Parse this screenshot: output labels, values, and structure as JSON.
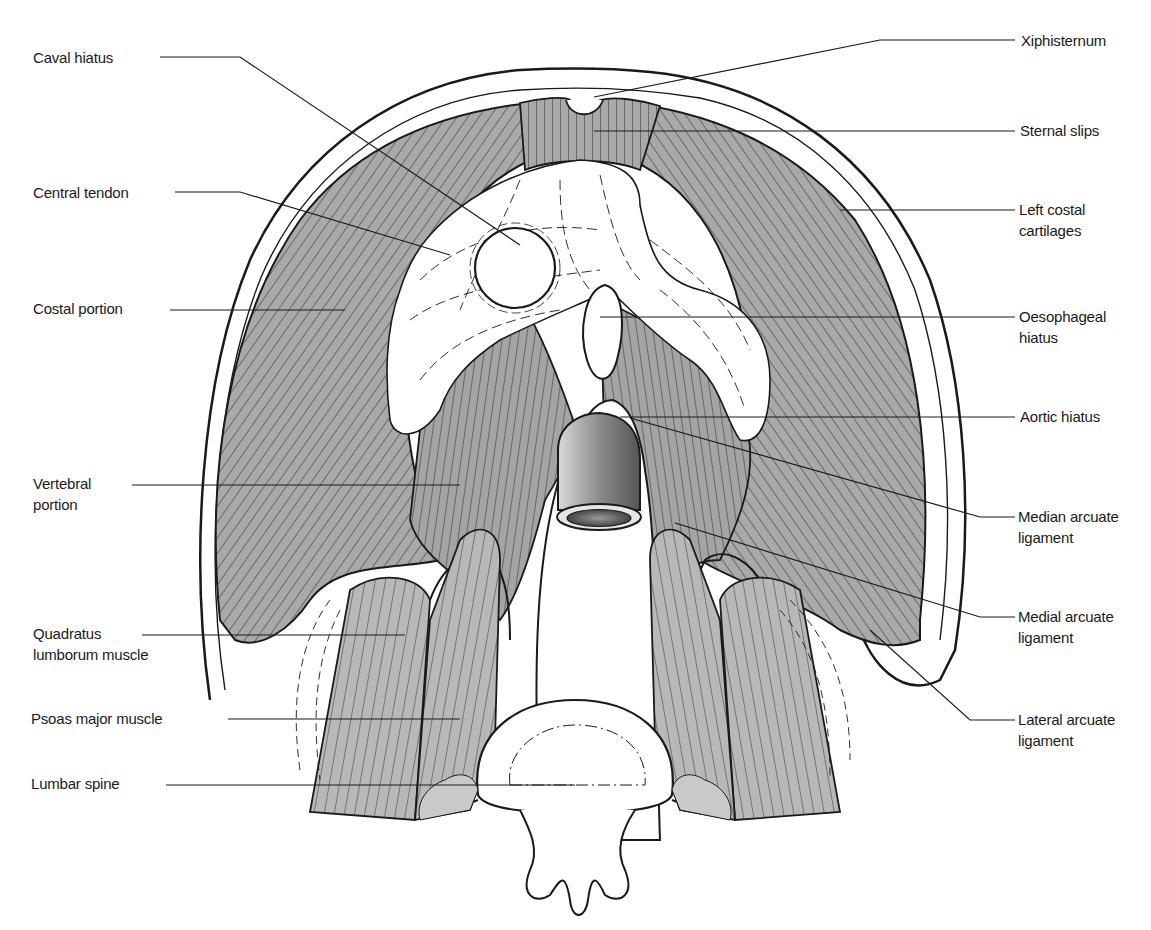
{
  "figure": {
    "colors": {
      "muscle_fill": "#a9a9a9",
      "muscle_light": "#c8c8c8",
      "tendon_fill": "#ffffff",
      "outline": "#1a1a1a",
      "aorta_dark": "#6e6e6e",
      "aorta_light": "#d9d9d9",
      "background": "#ffffff"
    },
    "labels_left": [
      {
        "id": "caval-hiatus",
        "text": "Caval hiatus",
        "x": 33,
        "y": 47
      },
      {
        "id": "central-tendon",
        "text": "Central tendon",
        "x": 33,
        "y": 182
      },
      {
        "id": "costal-portion",
        "text": "Costal portion",
        "x": 33,
        "y": 298
      },
      {
        "id": "vertebral-portion",
        "text": "Vertebral\nportion",
        "x": 33,
        "y": 473
      },
      {
        "id": "quadratus-lumborum",
        "text": "Quadratus\nlumborum muscle",
        "x": 33,
        "y": 623
      },
      {
        "id": "psoas-major",
        "text": "Psoas major muscle",
        "x": 31,
        "y": 708
      },
      {
        "id": "lumbar-spine",
        "text": "Lumbar spine",
        "x": 31,
        "y": 773
      }
    ],
    "labels_right": [
      {
        "id": "xiphisternum",
        "text": "Xiphisternum",
        "x": 1021,
        "y": 32
      },
      {
        "id": "sternal-slips",
        "text": "Sternal slips",
        "x": 1020,
        "y": 121
      },
      {
        "id": "left-costal-cartilages",
        "text": "Left costal\ncartilages",
        "x": 1019,
        "y": 200
      },
      {
        "id": "oesophageal-hiatus",
        "text": "Oesophageal\nhiatus",
        "x": 1019,
        "y": 305
      },
      {
        "id": "aortic-hiatus",
        "text": "Aortic hiatus",
        "x": 1020,
        "y": 405
      },
      {
        "id": "median-arcuate-ligament",
        "text": "Median arcuate\nligament",
        "x": 1018,
        "y": 505
      },
      {
        "id": "medial-arcuate-ligament",
        "text": "Medial arcuate\nligament",
        "x": 1018,
        "y": 605
      },
      {
        "id": "lateral-arcuate-ligament",
        "text": "Lateral arcuate\nligament",
        "x": 1018,
        "y": 708
      }
    ]
  }
}
